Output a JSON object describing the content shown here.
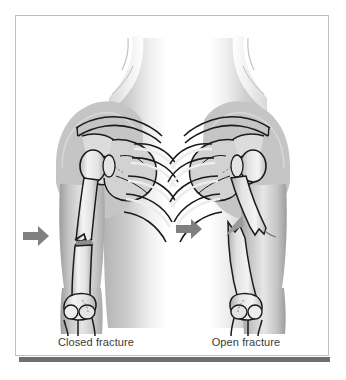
{
  "figure": {
    "kind": "medical-illustration",
    "background_color": "#ffffff",
    "frame": {
      "border_color": "#bfbfbf",
      "shadow_color": "#6e6e73"
    }
  },
  "panels": [
    {
      "id": "closed",
      "caption": "Closed fracture",
      "arrow": {
        "name": "fracture-pointer-arrow",
        "color": "#808080",
        "direction": "right"
      },
      "description": "Left upper arm and shoulder seen from the front; the humeral shaft has an oblique break with the bone ends still aligned beneath unbroken skin."
    },
    {
      "id": "open",
      "caption": "Open fracture",
      "arrow": {
        "name": "fracture-pointer-arrow",
        "color": "#808080",
        "direction": "right"
      },
      "description": "Right upper arm and shoulder; the humeral shaft is broken into displaced fragments and the sharp lower bone end pierces outward through the skin."
    }
  ],
  "anatomy": {
    "labels_visible": false,
    "structures": [
      "clavicle",
      "scapula",
      "acromion",
      "humeral head",
      "humeral shaft",
      "ribs",
      "elbow joint",
      "radius",
      "ulna"
    ]
  },
  "palette": {
    "skin_light": "#f2f2f2",
    "skin_mid": "#c9c9c9",
    "skin_shadow": "#8f8f8f",
    "bone_light": "#fbfbfb",
    "bone_mid": "#d6d6d6",
    "outline": "#1b1b1b",
    "arrow": "#808080",
    "caption_text": "#3b3b3b"
  }
}
